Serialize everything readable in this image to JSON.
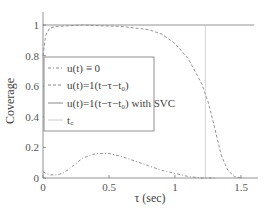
{
  "chart_data": {
    "type": "line",
    "title": "",
    "xlabel": "τ (sec)",
    "ylabel": "Coverage",
    "xlim": [
      0,
      1.6
    ],
    "ylim": [
      0,
      1.05
    ],
    "xticks": [
      "0",
      "0.5",
      "1",
      "1.5"
    ],
    "yticks": [
      "0",
      "0.2",
      "0.4",
      "0.6",
      "0.8",
      "1"
    ],
    "grid": false,
    "legend_position": "center-left",
    "series": [
      {
        "name": "u(t) ≡ 0",
        "style": "dash-dot",
        "color": "#888888",
        "x": [
          0,
          0.05,
          0.1,
          0.15,
          0.2,
          0.3,
          0.4,
          0.5,
          0.6,
          0.7,
          0.8,
          0.9,
          1.0,
          1.1,
          1.2,
          1.3
        ],
        "y": [
          0.04,
          0.02,
          0.02,
          0.03,
          0.06,
          0.13,
          0.16,
          0.16,
          0.14,
          0.11,
          0.08,
          0.05,
          0.03,
          0.01,
          0.0,
          0.0
        ]
      },
      {
        "name": "u(t)=1(t−τ−t0)",
        "style": "dashed",
        "color": "#888888",
        "x": [
          0,
          0.02,
          0.05,
          0.1,
          0.3,
          0.6,
          0.8,
          0.9,
          1.0,
          1.1,
          1.2,
          1.25,
          1.3,
          1.35,
          1.4,
          1.45,
          1.5
        ],
        "y": [
          0.8,
          0.93,
          0.98,
          0.99,
          1.0,
          0.99,
          0.97,
          0.94,
          0.88,
          0.78,
          0.62,
          0.5,
          0.33,
          0.15,
          0.05,
          0.01,
          0.0
        ]
      },
      {
        "name": "u(t)=1(t−τ−t0) with SVC",
        "style": "solid",
        "color": "#888888",
        "x": [
          0,
          1.6
        ],
        "y": [
          1.0,
          1.0
        ]
      },
      {
        "name": "tc",
        "style": "solid-thin",
        "color": "#bbbbbb",
        "x": [
          1.23,
          1.23
        ],
        "y": [
          0,
          1.05
        ]
      }
    ]
  },
  "axes": {
    "xlabel": "τ (sec)",
    "ylabel": "Coverage",
    "xticks": [
      {
        "v": 0,
        "label": "0"
      },
      {
        "v": 0.5,
        "label": "0.5"
      },
      {
        "v": 1,
        "label": "1"
      },
      {
        "v": 1.5,
        "label": "1.5"
      }
    ],
    "yticks": [
      {
        "v": 0,
        "label": "0"
      },
      {
        "v": 0.2,
        "label": "0.2"
      },
      {
        "v": 0.4,
        "label": "0.4"
      },
      {
        "v": 0.6,
        "label": "0.6"
      },
      {
        "v": 0.8,
        "label": "0.8"
      },
      {
        "v": 1,
        "label": "1"
      }
    ]
  },
  "legend": {
    "items": [
      {
        "label": "u(t) ≡ 0"
      },
      {
        "label": "u(t)=1(t−τ−t₀)"
      },
      {
        "label": "u(t)=1(t−τ−t₀) with SVC"
      },
      {
        "label": "t꜀"
      }
    ]
  }
}
